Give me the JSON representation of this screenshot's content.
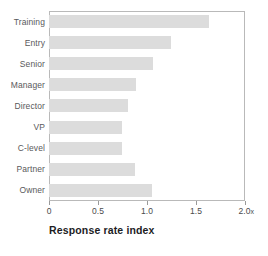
{
  "chart_data": {
    "type": "bar",
    "orientation": "horizontal",
    "title": "",
    "xlabel": "Response rate index",
    "ylabel": "",
    "categories": [
      "Training",
      "Entry",
      "Senior",
      "Manager",
      "Director",
      "VP",
      "C-level",
      "Partner",
      "Owner"
    ],
    "values": [
      1.63,
      1.24,
      1.06,
      0.89,
      0.81,
      0.74,
      0.74,
      0.88,
      1.05
    ],
    "xlim": [
      0,
      2.0
    ],
    "xticks": [
      0,
      0.5,
      1.0,
      1.5,
      2.0
    ],
    "xticklabels": [
      "0",
      "0.5",
      "1.0",
      "1.5",
      "2.0"
    ],
    "x_unit_suffix": "x",
    "grid": false,
    "legend": null,
    "bar_color": "#dcdcdc",
    "frame_color": "#b9b9b9",
    "label_color": "#59595b",
    "title_color": "#1d1d1f"
  }
}
